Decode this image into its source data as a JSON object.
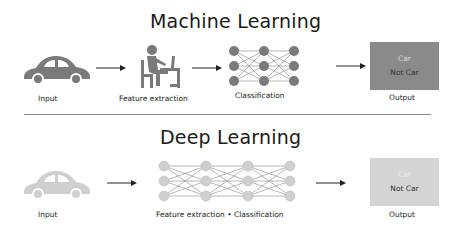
{
  "machine_learning": {
    "title": "Machine Learning",
    "stages": [
      {
        "icon": "car-icon",
        "label": "Input"
      },
      {
        "icon": "person-at-desk-icon",
        "label": "Feature extraction"
      },
      {
        "icon": "neural-network-icon",
        "label": "Classification"
      },
      {
        "icon": "output-box",
        "label": "Output"
      }
    ],
    "output_box": {
      "line1": "Car",
      "line2": "Not Car",
      "color": "#8a8a8a"
    },
    "icon_color": "#7a7a7a"
  },
  "deep_learning": {
    "title": "Deep Learning",
    "stages": [
      {
        "icon": "car-icon",
        "label": "Input"
      },
      {
        "icon": "neural-network-icon",
        "label": "Feature extraction • Classification"
      },
      {
        "icon": "output-box",
        "label": "Output"
      }
    ],
    "output_box": {
      "line1": "Car",
      "line2": "Not Car",
      "color": "#d4d4d4"
    },
    "icon_color": "#cfcfcf"
  }
}
